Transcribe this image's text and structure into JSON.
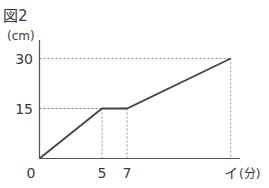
{
  "chart_data": {
    "type": "line",
    "title": "図2",
    "xlabel": "(分)",
    "ylabel": "(cm)",
    "xlim": [
      0,
      15.3
    ],
    "ylim": [
      0,
      30
    ],
    "grid": false,
    "x_ticks": [
      {
        "value": 0,
        "label": "0"
      },
      {
        "value": 5,
        "label": "5"
      },
      {
        "value": 7,
        "label": "7"
      },
      {
        "value": 15.3,
        "label": "イ"
      }
    ],
    "y_ticks": [
      {
        "value": 15,
        "label": "15"
      },
      {
        "value": 30,
        "label": "30"
      }
    ],
    "series": [
      {
        "name": "height",
        "points": [
          {
            "x": 0,
            "y": 0
          },
          {
            "x": 5,
            "y": 15
          },
          {
            "x": 7,
            "y": 15
          },
          {
            "x": 15.3,
            "y": 30
          }
        ]
      }
    ],
    "guides": [
      {
        "x": 5,
        "y": 15
      },
      {
        "x": 7,
        "y": 15
      },
      {
        "x": 15.3,
        "y": 30
      }
    ],
    "colors": {
      "line": "#444444",
      "axis": "#555555",
      "guide": "#8a8a8a",
      "text": "#3a3a3a"
    }
  }
}
